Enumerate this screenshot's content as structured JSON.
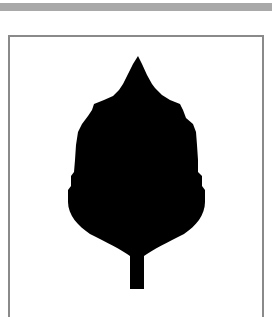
{
  "figure": {
    "caption": "",
    "colors": {
      "band": "#a9a9a9",
      "frame_border": "#8a8a8a",
      "background": "#ffffff",
      "silhouette": "#000000"
    }
  }
}
